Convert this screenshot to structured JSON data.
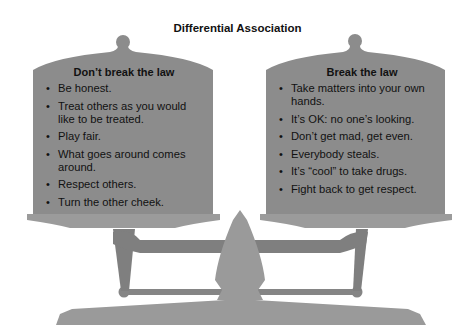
{
  "title": "Differential Association",
  "left_pan": {
    "heading": "Don’t break the law",
    "items": [
      "Be honest.",
      "Treat others as you would like to be treated.",
      "Play fair.",
      "What goes around comes around.",
      "Respect others.",
      "Turn the other cheek."
    ]
  },
  "right_pan": {
    "heading": "Break the law",
    "items": [
      "Take matters into your own hands.",
      "It’s OK: no one’s looking.",
      "Don’t get mad, get even.",
      "Everybody steals.",
      "It’s “cool” to take drugs.",
      "Fight back to get respect."
    ]
  },
  "colors": {
    "pan_body": "#8c8c8c",
    "pan_brim": "#9b9b9b",
    "scale_arm": "#7f7f7f",
    "post": "#9a9a9a",
    "text": "#111111"
  }
}
